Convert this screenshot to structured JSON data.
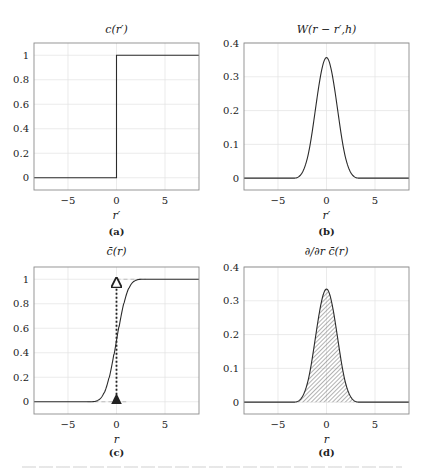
{
  "figure": {
    "panels": [
      {
        "id": "a",
        "label": "(a)",
        "title": "c(r′)",
        "xlabel": "r′"
      },
      {
        "id": "b",
        "label": "(b)",
        "title": "W(r − r′,h)",
        "xlabel": "r′"
      },
      {
        "id": "c",
        "label": "(c)",
        "title": "c̄(r)",
        "xlabel": "r"
      },
      {
        "id": "d",
        "label": "(d)",
        "title": "∂/∂r c̄(r)",
        "xlabel": "r"
      }
    ]
  },
  "chart_data": [
    {
      "panel": "a",
      "type": "line",
      "title": "c(r′)",
      "xlabel": "r′",
      "ylabel": "",
      "xlim": [
        -8.5,
        8.5
      ],
      "ylim": [
        -0.1,
        1.1
      ],
      "xticks": [
        -5,
        0,
        5
      ],
      "yticks": [
        0,
        0.2,
        0.4,
        0.6,
        0.8,
        1
      ],
      "ytick_labels": [
        "0",
        "0.2",
        "0.4",
        "0.6",
        "0.8",
        "1"
      ],
      "grid": true,
      "series": [
        {
          "name": "step",
          "function": "step",
          "x": [
            -8.5,
            0,
            0,
            8.5
          ],
          "y": [
            0,
            0,
            1,
            1
          ]
        }
      ]
    },
    {
      "panel": "b",
      "type": "line",
      "title": "W(r − r′,h)",
      "xlabel": "r′",
      "ylabel": "",
      "xlim": [
        -8.5,
        8.5
      ],
      "ylim": [
        -0.035,
        0.4
      ],
      "xticks": [
        -5,
        0,
        5
      ],
      "yticks": [
        0,
        0.1,
        0.2,
        0.3,
        0.4
      ],
      "ytick_labels": [
        "0",
        "0.1",
        "0.2",
        "0.3",
        "0.4"
      ],
      "grid": true,
      "series": [
        {
          "name": "kernel",
          "function": "kernel",
          "peak": 0.357,
          "support": 3.5
        }
      ]
    },
    {
      "panel": "c",
      "type": "line",
      "title": "c̄(r)",
      "xlabel": "r",
      "ylabel": "",
      "xlim": [
        -8.5,
        8.5
      ],
      "ylim": [
        -0.1,
        1.1
      ],
      "xticks": [
        -5,
        0,
        5
      ],
      "yticks": [
        0,
        0.2,
        0.4,
        0.6,
        0.8,
        1
      ],
      "ytick_labels": [
        "0",
        "0.2",
        "0.4",
        "0.6",
        "0.8",
        "1"
      ],
      "grid": true,
      "series": [
        {
          "name": "smoothed",
          "function": "integral",
          "support": 3
        }
      ],
      "annotations": [
        {
          "type": "dashed-hline",
          "y": 1,
          "x": [
            0,
            3
          ]
        },
        {
          "type": "dashed-hline",
          "y": 0,
          "x": [
            -3,
            1
          ]
        },
        {
          "type": "double-arrow",
          "x": 0,
          "y": [
            0,
            1
          ],
          "style": "dotted"
        }
      ]
    },
    {
      "panel": "d",
      "type": "area",
      "title": "∂/∂r c̄(r)",
      "xlabel": "r",
      "ylabel": "",
      "xlim": [
        -8.5,
        8.5
      ],
      "ylim": [
        -0.035,
        0.4
      ],
      "xticks": [
        -5,
        0,
        5
      ],
      "yticks": [
        0,
        0.1,
        0.2,
        0.3,
        0.4
      ],
      "ytick_labels": [
        "0",
        "0.1",
        "0.2",
        "0.3",
        "0.4"
      ],
      "grid": true,
      "series": [
        {
          "name": "derivative",
          "function": "kernel",
          "peak": 0.335,
          "support": 3.5,
          "fill": "hatched"
        }
      ]
    }
  ],
  "colors": {
    "line": "#2b2b2b",
    "grid": "#e3e3e3",
    "axis": "#8c8c8c",
    "hatch": "#555555",
    "dashed": "#b5b5b5"
  }
}
